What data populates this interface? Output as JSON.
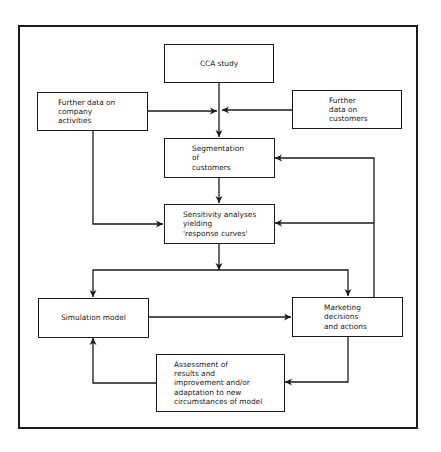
{
  "diagram": {
    "type": "flowchart",
    "nodes": {
      "cca_study": "CCA study",
      "company_data": "Further data on\ncompany\nactivities",
      "customer_data": "Further\ndata on\ncustomers",
      "segmentation": "Segmentation\nof\ncustomers",
      "sensitivity": "Sensitivity analyses\nyielding\n'response curves'",
      "simulation": "Simulation model",
      "marketing": "Marketing\ndecisions\nand actions",
      "assessment": "Assessment of\nresults and\nimprovement and/or\nadaptation to new\ncircumstances of model"
    },
    "edges": [
      {
        "from": "cca_study",
        "to": "segmentation"
      },
      {
        "from": "company_data",
        "to": "segmentation"
      },
      {
        "from": "customer_data",
        "to": "segmentation"
      },
      {
        "from": "company_data",
        "to": "sensitivity"
      },
      {
        "from": "segmentation",
        "to": "sensitivity"
      },
      {
        "from": "sensitivity",
        "to": "simulation"
      },
      {
        "from": "sensitivity",
        "to": "marketing"
      },
      {
        "from": "simulation",
        "to": "marketing"
      },
      {
        "from": "marketing",
        "to": "segmentation"
      },
      {
        "from": "marketing",
        "to": "sensitivity"
      },
      {
        "from": "marketing",
        "to": "assessment"
      },
      {
        "from": "assessment",
        "to": "simulation"
      }
    ]
  }
}
